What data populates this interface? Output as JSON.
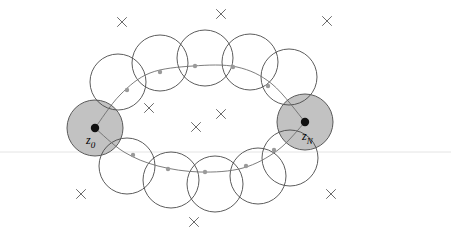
{
  "figure": {
    "type": "diagram",
    "canvas": {
      "width": 451,
      "height": 235,
      "background": "#ffffff"
    },
    "colors": {
      "background": "#ffffff",
      "ball_outline": "#4a4a4a",
      "ball_shaded_fill": "#c2c2c2",
      "ball_shaded_outline": "#5a5a5a",
      "path_curve": "#6e6e6e",
      "node_dot": "#9a9a9a",
      "endpoint_dot": "#111111",
      "cross_mark": "#6b6b6b",
      "ground_line": "#e4e4e4"
    }
  },
  "labels": {
    "start": {
      "symbol": "z",
      "subscript": "0",
      "text": "z0"
    },
    "end": {
      "symbol": "z",
      "subscript": "N",
      "text": "zN"
    }
  },
  "geometry": {
    "ball_radius_open": 28,
    "ball_radius_shaded": 28,
    "endpoint_dot_radius": 4.2,
    "node_dot_radius": 2.2,
    "cross_arm": 4.5,
    "ground_line_y": 152,
    "shaded_balls": [
      {
        "name": "z0",
        "cx": 95,
        "cy": 128,
        "r": 28
      },
      {
        "name": "zN",
        "cx": 305,
        "cy": 122,
        "r": 28
      }
    ],
    "open_balls_top": [
      {
        "cx": 118,
        "cy": 82,
        "r": 28
      },
      {
        "cx": 160,
        "cy": 63,
        "r": 28
      },
      {
        "cx": 205,
        "cy": 58,
        "r": 28
      },
      {
        "cx": 250,
        "cy": 62,
        "r": 28
      },
      {
        "cx": 289,
        "cy": 77,
        "r": 28
      }
    ],
    "open_balls_bottom": [
      {
        "cx": 127,
        "cy": 166,
        "r": 28
      },
      {
        "cx": 171,
        "cy": 180,
        "r": 28
      },
      {
        "cx": 215,
        "cy": 184,
        "r": 28
      },
      {
        "cx": 258,
        "cy": 176,
        "r": 28
      },
      {
        "cx": 290,
        "cy": 158,
        "r": 28
      }
    ],
    "path_top_points": [
      {
        "x": 95,
        "y": 128
      },
      {
        "x": 120,
        "y": 95
      },
      {
        "x": 150,
        "y": 73
      },
      {
        "x": 193,
        "y": 66
      },
      {
        "x": 237,
        "y": 67
      },
      {
        "x": 272,
        "y": 84
      },
      {
        "x": 305,
        "y": 122
      }
    ],
    "path_bottom_points": [
      {
        "x": 95,
        "y": 128
      },
      {
        "x": 124,
        "y": 152
      },
      {
        "x": 158,
        "y": 166
      },
      {
        "x": 200,
        "y": 172
      },
      {
        "x": 243,
        "y": 168
      },
      {
        "x": 278,
        "y": 150
      },
      {
        "x": 305,
        "y": 122
      }
    ],
    "node_dots": [
      {
        "x": 127,
        "y": 90
      },
      {
        "x": 160,
        "y": 72
      },
      {
        "x": 195,
        "y": 66
      },
      {
        "x": 233,
        "y": 67
      },
      {
        "x": 268,
        "y": 86
      },
      {
        "x": 133,
        "y": 155
      },
      {
        "x": 168,
        "y": 169
      },
      {
        "x": 205,
        "y": 172
      },
      {
        "x": 246,
        "y": 166
      },
      {
        "x": 274,
        "y": 150
      }
    ],
    "cross_marks": [
      {
        "x": 122,
        "y": 22,
        "region": "outside-top-left"
      },
      {
        "x": 221,
        "y": 14,
        "region": "outside-top-center"
      },
      {
        "x": 327,
        "y": 21,
        "region": "outside-top-right"
      },
      {
        "x": 149,
        "y": 108,
        "region": "inside-left"
      },
      {
        "x": 221,
        "y": 114,
        "region": "inside-center"
      },
      {
        "x": 196,
        "y": 127,
        "region": "inside-lower"
      },
      {
        "x": 81,
        "y": 194,
        "region": "outside-bottom-left"
      },
      {
        "x": 331,
        "y": 194,
        "region": "outside-bottom-right"
      },
      {
        "x": 194,
        "y": 222,
        "region": "outside-bottom-center"
      }
    ]
  }
}
